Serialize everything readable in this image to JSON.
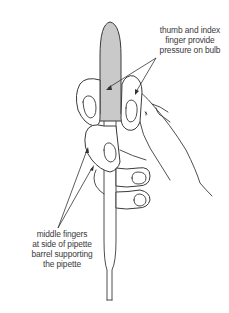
{
  "figure": {
    "colors": {
      "bulb_fill": "#c9c9c9",
      "line": "#3a3a3a",
      "background": "#ffffff"
    }
  },
  "annotations": {
    "top": {
      "lines": [
        "thumb and index",
        "finger provide",
        "pressure on bulb"
      ]
    },
    "bottom": {
      "lines": [
        "middle fingers",
        "at side of pipette",
        "barrel supporting",
        "the pipette"
      ]
    }
  }
}
